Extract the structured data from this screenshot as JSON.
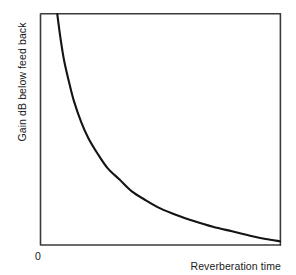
{
  "figure": {
    "name": "gain-vs-reverberation-time-figure",
    "background_color": "#ffffff",
    "line_color": "#141414",
    "frame_color": "#3a3a3a"
  },
  "chart_data": {
    "type": "line",
    "title": "",
    "subtitle": "",
    "xlabel": "Reverberation time",
    "ylabel": "Gain dB below feed back",
    "grid": false,
    "legend": null,
    "xlim": [
      0,
      1
    ],
    "ylim": [
      0,
      1
    ],
    "x_tick_labels": [
      "0"
    ],
    "y_tick_labels": [],
    "annotations": [],
    "series": [
      {
        "name": "Gain below feedback vs reverberation time",
        "description": "Monotonically decreasing convex decay curve; steep fall near the origin flattening to an asymptote along the horizontal axis.",
        "x": [
          0.07,
          0.08,
          0.09,
          0.1,
          0.12,
          0.14,
          0.17,
          0.2,
          0.24,
          0.28,
          0.33,
          0.38,
          0.44,
          0.5,
          0.57,
          0.64,
          0.72,
          0.8,
          0.88,
          0.94,
          1.0
        ],
        "y": [
          1.0,
          0.92,
          0.85,
          0.79,
          0.7,
          0.62,
          0.53,
          0.46,
          0.39,
          0.33,
          0.28,
          0.23,
          0.19,
          0.155,
          0.125,
          0.1,
          0.075,
          0.055,
          0.035,
          0.022,
          0.012
        ]
      }
    ]
  },
  "labels": {
    "y_axis": "Gain dB below feed back",
    "x_axis": "Reverberation time",
    "origin": "0"
  }
}
